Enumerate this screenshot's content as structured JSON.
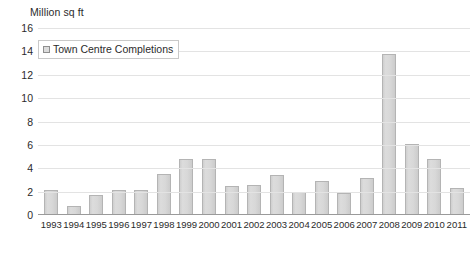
{
  "chart_data": {
    "type": "bar",
    "title": "",
    "subtitle": "",
    "xlabel": "",
    "ylabel": "Million sq ft",
    "ylim": [
      0,
      16
    ],
    "ytick_step": 2,
    "yticks": [
      16,
      14,
      12,
      10,
      8,
      6,
      4,
      2,
      0
    ],
    "grid": true,
    "legend_position": "top-left",
    "categories": [
      "1993",
      "1994",
      "1995",
      "1996",
      "1997",
      "1998",
      "1999",
      "2000",
      "2001",
      "2002",
      "2003",
      "2004",
      "2005",
      "2006",
      "2007",
      "2008",
      "2009",
      "2010",
      "2011"
    ],
    "series": [
      {
        "name": "Town Centre Completions",
        "values": [
          2.1,
          0.8,
          1.7,
          2.1,
          2.1,
          3.5,
          4.8,
          4.8,
          2.5,
          2.6,
          3.4,
          2.0,
          2.9,
          1.9,
          3.2,
          13.8,
          6.1,
          4.8,
          2.3
        ]
      }
    ],
    "colors": {
      "bar_fill": "#d6d6d6",
      "bar_border": "#b4b4b4",
      "gridline": "#e3e3e3",
      "axis_line": "#9a9a9a",
      "text": "#2b2b2b",
      "background": "#ffffff"
    }
  },
  "legend": {
    "items": [
      {
        "label": "Town Centre Completions",
        "swatch": "legend-swatch-icon"
      }
    ]
  }
}
